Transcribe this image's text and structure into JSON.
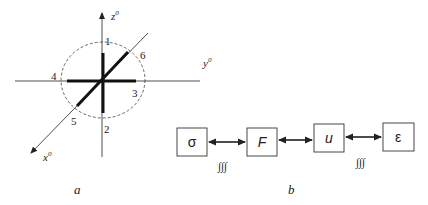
{
  "figure_a": {
    "caption": "a",
    "axes": {
      "z": {
        "label": "z",
        "sup": "0"
      },
      "y": {
        "label": "y",
        "sup": "0"
      },
      "x": {
        "label": "x",
        "sup": "0"
      }
    },
    "directions": [
      "1",
      "2",
      "3",
      "4",
      "5",
      "6"
    ]
  },
  "figure_b": {
    "caption": "b",
    "boxes": [
      {
        "label": "σ"
      },
      {
        "label": "F"
      },
      {
        "label": "u"
      },
      {
        "label": "ε"
      }
    ],
    "integral_marks": [
      "∫∫∫",
      "∫∫∫"
    ]
  },
  "colors": {
    "stroke": "#222222",
    "background": "#ffffff"
  }
}
